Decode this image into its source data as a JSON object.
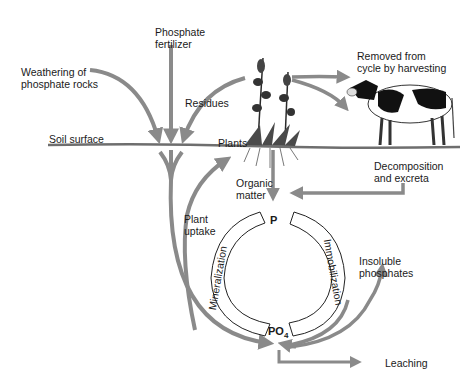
{
  "diagram": {
    "colors": {
      "arrow": "#8a8a8a",
      "soil_line": "#6e6e6e",
      "text": "#1a1a1a",
      "outline": "#222222"
    },
    "labels": {
      "weathering": [
        "Weathering of",
        "phosphate rocks"
      ],
      "fertilizer": [
        "Phosphate",
        "fertilizer"
      ],
      "residues": "Residues",
      "soil_surface": "Soil surface",
      "plants": "Plants",
      "removed": [
        "Removed from",
        "cycle by harvesting"
      ],
      "decomposition": [
        "Decomposition",
        "and excreta"
      ],
      "organic_matter": [
        "Organic",
        "matter"
      ],
      "plant_uptake": [
        "Plant",
        "uptake"
      ],
      "p_node": "P",
      "po4_node": "PO",
      "po4_sub": "4",
      "mineralization": "Mineralization",
      "immobilization": "Immobilization",
      "insoluble": [
        "Insoluble",
        "phosphates"
      ],
      "leaching": "Leaching"
    }
  }
}
